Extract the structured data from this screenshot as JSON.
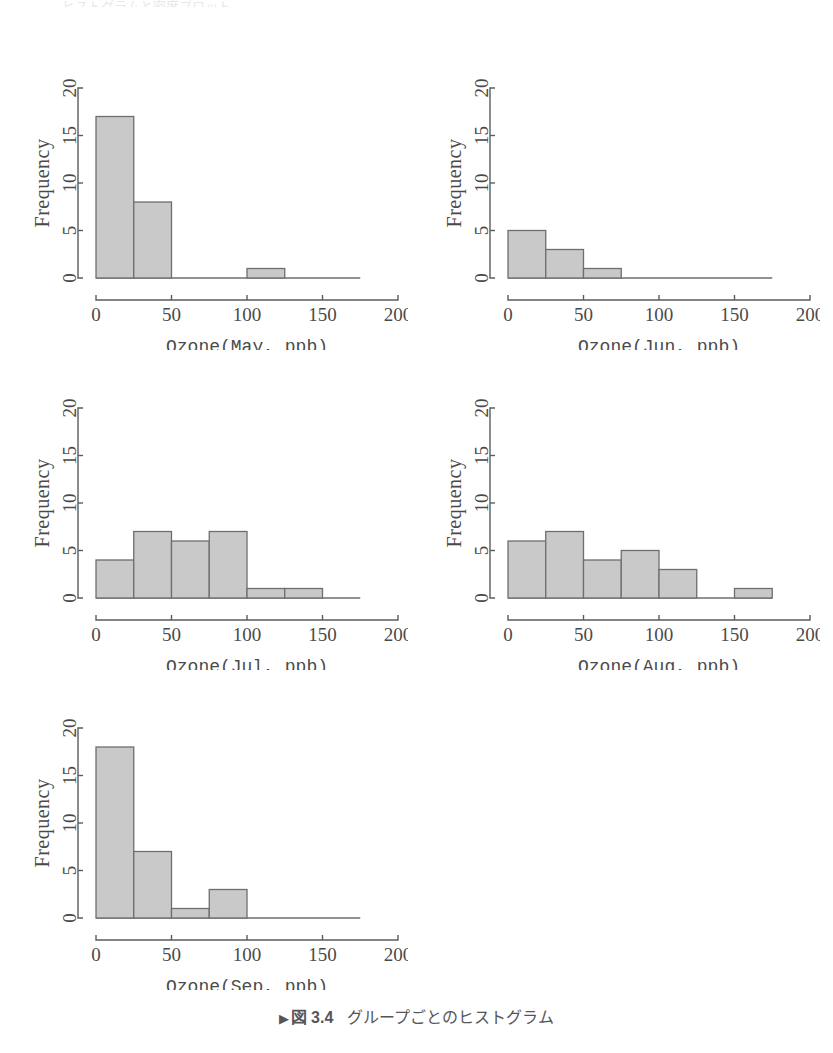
{
  "page": {
    "top_bleed_text": "ヒストグラムと密度プロット",
    "background": "#ffffff",
    "text_color": "#4a4a4a"
  },
  "caption": {
    "marker": "▶",
    "figure_number": "図 3.4",
    "text": "グループごとのヒストグラム"
  },
  "style": {
    "bar_fill": "#c9c9c9",
    "bar_stroke": "#6e6e6e",
    "axis_color": "#5c5c5c"
  },
  "chart_data": [
    {
      "type": "bar",
      "title": "",
      "xlabel": "Ozone(May, ppb)",
      "ylabel": "Frequency",
      "xlim": [
        0,
        200
      ],
      "ylim": [
        0,
        20
      ],
      "xticks": [
        0,
        50,
        100,
        150,
        200
      ],
      "yticks": [
        0,
        5,
        10,
        15,
        20
      ],
      "bin_width": 25,
      "bin_starts": [
        0,
        25,
        50,
        75,
        100,
        125,
        150
      ],
      "categories": [
        "0-25",
        "25-50",
        "50-75",
        "75-100",
        "100-125",
        "125-150",
        "150-175"
      ],
      "values": [
        17,
        8,
        0,
        0,
        1,
        0,
        0
      ],
      "grid": false,
      "legend": "none"
    },
    {
      "type": "bar",
      "title": "",
      "xlabel": "Ozone(Jun, ppb)",
      "ylabel": "Frequency",
      "xlim": [
        0,
        200
      ],
      "ylim": [
        0,
        20
      ],
      "xticks": [
        0,
        50,
        100,
        150,
        200
      ],
      "yticks": [
        0,
        5,
        10,
        15,
        20
      ],
      "bin_width": 25,
      "bin_starts": [
        0,
        25,
        50,
        75,
        100,
        125,
        150
      ],
      "categories": [
        "0-25",
        "25-50",
        "50-75",
        "75-100",
        "100-125",
        "125-150",
        "150-175"
      ],
      "values": [
        5,
        3,
        1,
        0,
        0,
        0,
        0
      ],
      "grid": false,
      "legend": "none"
    },
    {
      "type": "bar",
      "title": "",
      "xlabel": "Ozone(Jul, ppb)",
      "ylabel": "Frequency",
      "xlim": [
        0,
        200
      ],
      "ylim": [
        0,
        20
      ],
      "xticks": [
        0,
        50,
        100,
        150,
        200
      ],
      "yticks": [
        0,
        5,
        10,
        15,
        20
      ],
      "bin_width": 25,
      "bin_starts": [
        0,
        25,
        50,
        75,
        100,
        125,
        150
      ],
      "categories": [
        "0-25",
        "25-50",
        "50-75",
        "75-100",
        "100-125",
        "125-150",
        "150-175"
      ],
      "values": [
        4,
        7,
        6,
        7,
        1,
        1,
        0
      ],
      "grid": false,
      "legend": "none"
    },
    {
      "type": "bar",
      "title": "",
      "xlabel": "Ozone(Aug, ppb)",
      "ylabel": "Frequency",
      "xlim": [
        0,
        200
      ],
      "ylim": [
        0,
        20
      ],
      "xticks": [
        0,
        50,
        100,
        150,
        200
      ],
      "yticks": [
        0,
        5,
        10,
        15,
        20
      ],
      "bin_width": 25,
      "bin_starts": [
        0,
        25,
        50,
        75,
        100,
        125,
        150
      ],
      "categories": [
        "0-25",
        "25-50",
        "50-75",
        "75-100",
        "100-125",
        "125-150",
        "150-175"
      ],
      "values": [
        6,
        7,
        4,
        5,
        3,
        0,
        1
      ],
      "grid": false,
      "legend": "none"
    },
    {
      "type": "bar",
      "title": "",
      "xlabel": "Ozone(Sep, ppb)",
      "ylabel": "Frequency",
      "xlim": [
        0,
        200
      ],
      "ylim": [
        0,
        20
      ],
      "xticks": [
        0,
        50,
        100,
        150,
        200
      ],
      "yticks": [
        0,
        5,
        10,
        15,
        20
      ],
      "bin_width": 25,
      "bin_starts": [
        0,
        25,
        50,
        75,
        100,
        125,
        150
      ],
      "categories": [
        "0-25",
        "25-50",
        "50-75",
        "75-100",
        "100-125",
        "125-150",
        "150-175"
      ],
      "values": [
        18,
        7,
        1,
        3,
        0,
        0,
        0
      ],
      "grid": false,
      "legend": "none"
    }
  ]
}
